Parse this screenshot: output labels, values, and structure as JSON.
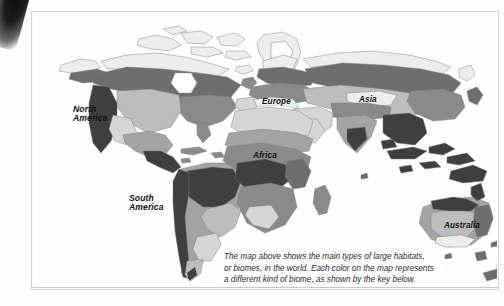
{
  "figure": {
    "kind": "world-biome-map",
    "caption_lines": [
      "The map above shows the main types of large habitats,",
      "or biomes, in the world. Each color on the map represents",
      "a different kind of biome, as shown by the key below."
    ]
  },
  "map": {
    "labels": {
      "north_america": "North\nAmerica",
      "north_america_line1": "North",
      "north_america_line2": "America",
      "south_america_line1": "South",
      "south_america_line2": "America",
      "europe": "Europe",
      "asia": "Asia",
      "africa": "Africa",
      "australia": "Australia"
    },
    "biome_colors": {
      "tundra_lightest": "#ededed",
      "desert_light": "#d6d6d6",
      "grassland_mid_light": "#bdbdbd",
      "savanna_mid": "#a3a3a3",
      "forest_mid_dark": "#8a8a8a",
      "taiga_dark": "#6e6e6e",
      "rainforest_darkest": "#3f3f3f",
      "ocean": "#ffffff",
      "outline": "#7a7a7a"
    },
    "page_frame_color": "#d4d4d4",
    "scan_artifact": "book-spine-shadow-top-left"
  }
}
